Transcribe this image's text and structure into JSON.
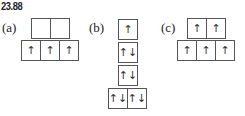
{
  "problem_number": "23.88",
  "parts": [
    {
      "label": "(a)",
      "rows": [
        [
          "",
          ""
        ],
        [
          "↑",
          "↑",
          "↑"
        ]
      ]
    },
    {
      "label": "(b)",
      "rows": [
        [
          "↑"
        ],
        [
          "↑↓"
        ],
        [
          "↑↓"
        ],
        [
          "↑↓",
          "↑↓"
        ]
      ]
    },
    {
      "label": "(c)",
      "rows": [
        [
          "↑",
          "↑"
        ],
        [
          "↑",
          "↑",
          "↑"
        ]
      ]
    }
  ]
}
